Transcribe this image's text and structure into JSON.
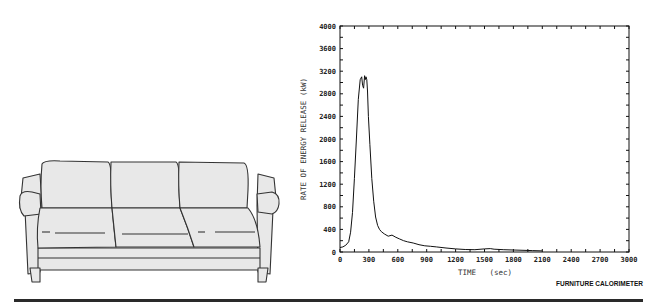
{
  "chart_data": {
    "type": "line",
    "title": "",
    "xlabel": "TIME   (sec)",
    "ylabel": "RATE OF ENERGY RELEASE (kW)",
    "xlim": [
      0,
      3000
    ],
    "ylim": [
      0,
      4000
    ],
    "xticks": [
      0,
      300,
      600,
      900,
      1200,
      1500,
      1800,
      2100,
      2400,
      2700,
      3000
    ],
    "xtick_labels": [
      "0",
      "300",
      "600",
      "900",
      "1200",
      "1500",
      "1800",
      "2100",
      "2400",
      "2700",
      "3000"
    ],
    "yticks": [
      0,
      400,
      800,
      1200,
      1600,
      2000,
      2400,
      2800,
      3200,
      3600,
      4000
    ],
    "ytick_labels": [
      "0",
      "400",
      "800",
      "1200",
      "1600",
      "2000",
      "2400",
      "2800",
      "3200",
      "3600",
      "4000"
    ],
    "grid": false,
    "annotation": "FURNITURE CALORIMETER",
    "series": [
      {
        "name": "Rate of energy release",
        "x": [
          0,
          30,
          60,
          90,
          110,
          130,
          150,
          170,
          190,
          210,
          225,
          235,
          245,
          255,
          262,
          270,
          278,
          285,
          295,
          310,
          330,
          350,
          370,
          390,
          410,
          430,
          460,
          500,
          540,
          580,
          620,
          660,
          700,
          760,
          820,
          880,
          940,
          1000,
          1100,
          1200,
          1300,
          1400,
          1500,
          1560,
          1600,
          1700,
          1800,
          1900,
          2000,
          2100
        ],
        "y": [
          80,
          90,
          120,
          180,
          350,
          700,
          1300,
          2000,
          2700,
          3050,
          3100,
          2950,
          2900,
          3120,
          3050,
          3100,
          3050,
          2850,
          2400,
          1900,
          1300,
          900,
          620,
          470,
          400,
          360,
          320,
          280,
          300,
          260,
          230,
          200,
          180,
          160,
          130,
          110,
          100,
          90,
          70,
          55,
          45,
          40,
          55,
          60,
          50,
          40,
          35,
          30,
          25,
          20
        ]
      }
    ]
  }
}
